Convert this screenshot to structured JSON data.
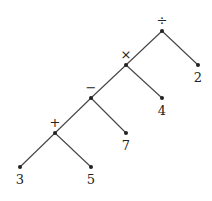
{
  "diagram": {
    "title": "",
    "type": "expression-tree",
    "nodes": [
      {
        "id": "div",
        "label": "÷",
        "x": 162,
        "y": 31,
        "label_pos": "above"
      },
      {
        "id": "mul",
        "label": "×",
        "x": 126,
        "y": 65,
        "label_pos": "above"
      },
      {
        "id": "sub",
        "label": "−",
        "x": 91,
        "y": 98,
        "label_pos": "above"
      },
      {
        "id": "add",
        "label": "+",
        "x": 55,
        "y": 133,
        "label_pos": "above"
      },
      {
        "id": "n2",
        "label": "2",
        "x": 198,
        "y": 65,
        "label_pos": "below"
      },
      {
        "id": "n4",
        "label": "4",
        "x": 162,
        "y": 98,
        "label_pos": "below"
      },
      {
        "id": "n7",
        "label": "7",
        "x": 126,
        "y": 133,
        "label_pos": "below"
      },
      {
        "id": "n3",
        "label": "3",
        "x": 20,
        "y": 167,
        "label_pos": "below"
      },
      {
        "id": "n5",
        "label": "5",
        "x": 91,
        "y": 167,
        "label_pos": "below"
      }
    ],
    "edges": [
      [
        "div",
        "mul"
      ],
      [
        "div",
        "n2"
      ],
      [
        "mul",
        "sub"
      ],
      [
        "mul",
        "n4"
      ],
      [
        "sub",
        "add"
      ],
      [
        "sub",
        "n7"
      ],
      [
        "add",
        "n3"
      ],
      [
        "add",
        "n5"
      ]
    ],
    "colors": {
      "line": "#444444",
      "node": "#222222",
      "text": "#222222"
    }
  }
}
